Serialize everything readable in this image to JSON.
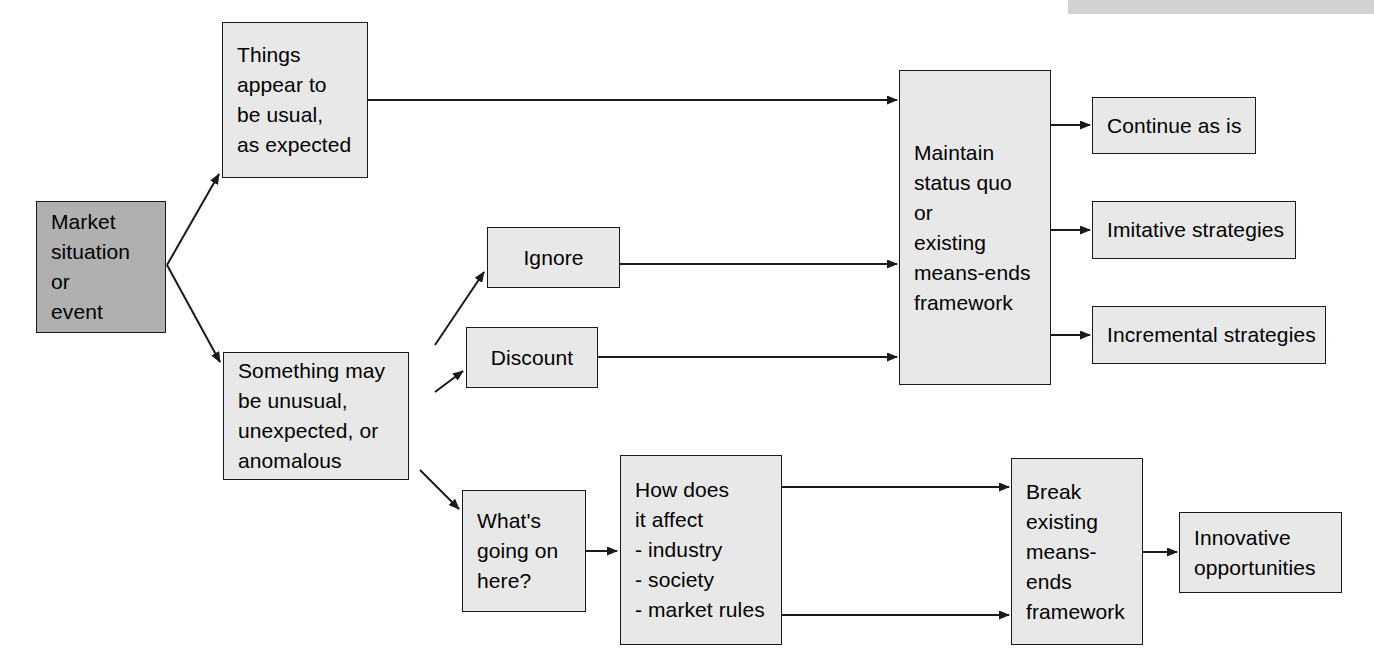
{
  "diagram": {
    "colors": {
      "node_fill": "#e8e8e8",
      "node_fill_dark": "#b0b0b0",
      "node_border": "#1a1a1a",
      "edge": "#1a1a1a",
      "top_strip": "#d2d2d2",
      "background": "#ffffff"
    },
    "top_strip_label": "",
    "nodes": {
      "market_situation": "Market\nsituation\nor\nevent",
      "things_usual": "Things\nappear to\nbe usual,\nas expected",
      "something_unusual": "Something may\nbe unusual,\nunexpected, or\nanomalous",
      "ignore": "Ignore",
      "discount": "Discount",
      "whats_going_on": "What's\ngoing on\nhere?",
      "how_does_it_affect": "How does\nit affect\n- industry\n- society\n- market rules",
      "maintain_status_quo": "Maintain\nstatus quo\nor\nexisting\nmeans-ends\nframework",
      "break_framework": "Break\nexisting\nmeans-\nends\nframework",
      "continue_as_is": "Continue as is",
      "imitative_strategies": "Imitative strategies",
      "incremental_strategies": "Incremental strategies",
      "innovative_opportunities": "Innovative\nopportunities"
    }
  }
}
